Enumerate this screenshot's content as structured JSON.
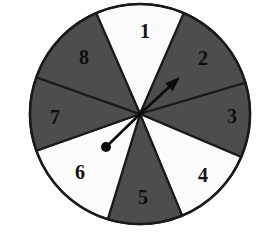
{
  "figure": {
    "background_color": "#ffffff",
    "outline_color": "#1a1a1a",
    "dark_sector_color": "#4d4d4d",
    "light_sector_color": "#fbfbfb",
    "pointer_color": "#0a0a0a"
  },
  "wheel": {
    "center_x": 140,
    "center_y": 114,
    "radius": 110,
    "sector_count": 8,
    "sectors": [
      {
        "label": "1",
        "fill": "light",
        "start_deg": 66.5,
        "end_deg": 113.5,
        "label_x": 145,
        "label_y": 33
      },
      {
        "label": "2",
        "fill": "dark",
        "start_deg": 16.5,
        "end_deg": 66.5,
        "label_x": 203,
        "label_y": 60
      },
      {
        "label": "3",
        "fill": "dark",
        "start_deg": -23.0,
        "end_deg": 16.5,
        "label_x": 232,
        "label_y": 118
      },
      {
        "label": "4",
        "fill": "light",
        "start_deg": -67.5,
        "end_deg": -23.0,
        "label_x": 203,
        "label_y": 177
      },
      {
        "label": "5",
        "fill": "dark",
        "start_deg": -107.0,
        "end_deg": -67.5,
        "label_x": 143,
        "label_y": 199
      },
      {
        "label": "6",
        "fill": "light",
        "start_deg": -160.5,
        "end_deg": -107.0,
        "label_x": 80,
        "label_y": 174
      },
      {
        "label": "7",
        "fill": "dark",
        "start_deg": 160.5,
        "end_deg": 199.5,
        "label_x": 55,
        "label_y": 119
      },
      {
        "label": "8",
        "fill": "dark",
        "start_deg": 113.5,
        "end_deg": 160.5,
        "label_x": 84,
        "label_y": 59
      }
    ]
  },
  "pointer": {
    "name": "spinner-needle",
    "pivot_x": 140,
    "pivot_y": 114,
    "arrow_tip_x": 180,
    "arrow_tip_y": 77,
    "tail_dot_x": 106,
    "tail_dot_y": 147,
    "tail_dot_radius": 5,
    "angle_deg": 42.8,
    "points_at_sector": "2"
  }
}
